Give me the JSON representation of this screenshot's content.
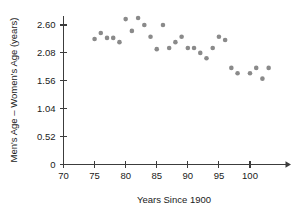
{
  "chart_data": {
    "type": "scatter",
    "title": "",
    "xlabel": "Years Since 1900",
    "ylabel": "Men's Age – Women's Age (years)",
    "xlim": [
      70,
      104
    ],
    "ylim": [
      0,
      2.86
    ],
    "xticks": [
      70,
      75,
      80,
      85,
      90,
      95,
      100
    ],
    "xtick_labels": [
      "70",
      "75",
      "80",
      "85",
      "90",
      "95",
      "100"
    ],
    "yticks": [
      0,
      0.52,
      1.04,
      1.56,
      2.08,
      2.6
    ],
    "ytick_labels": [
      "0",
      "0.52",
      "1.04",
      "1.56",
      "2.08",
      "2.60"
    ],
    "grid": false,
    "legend": false,
    "marker_color": "#8a8a8a",
    "marker_size": 4.6,
    "x_axis_arrow": true,
    "y_axis_arrow": false,
    "points": [
      {
        "x": 75,
        "y": 2.34
      },
      {
        "x": 76,
        "y": 2.45
      },
      {
        "x": 77,
        "y": 2.36
      },
      {
        "x": 78,
        "y": 2.36
      },
      {
        "x": 79,
        "y": 2.28
      },
      {
        "x": 80,
        "y": 2.71
      },
      {
        "x": 81,
        "y": 2.49
      },
      {
        "x": 82,
        "y": 2.73
      },
      {
        "x": 83,
        "y": 2.6
      },
      {
        "x": 84,
        "y": 2.38
      },
      {
        "x": 85,
        "y": 2.15
      },
      {
        "x": 86,
        "y": 2.6
      },
      {
        "x": 87,
        "y": 2.17
      },
      {
        "x": 88,
        "y": 2.28
      },
      {
        "x": 89,
        "y": 2.38
      },
      {
        "x": 90,
        "y": 2.17
      },
      {
        "x": 91,
        "y": 2.17
      },
      {
        "x": 92,
        "y": 2.08
      },
      {
        "x": 93,
        "y": 1.98
      },
      {
        "x": 94,
        "y": 2.17
      },
      {
        "x": 95,
        "y": 2.38
      },
      {
        "x": 96,
        "y": 2.32
      },
      {
        "x": 97,
        "y": 1.8
      },
      {
        "x": 98,
        "y": 1.7
      },
      {
        "x": 100,
        "y": 1.7
      },
      {
        "x": 101,
        "y": 1.8
      },
      {
        "x": 102,
        "y": 1.6
      },
      {
        "x": 103,
        "y": 1.8
      }
    ]
  },
  "axes": {
    "x_title": "Years Since 1900",
    "y_title": "Men's Age – Women's Age (years)"
  }
}
